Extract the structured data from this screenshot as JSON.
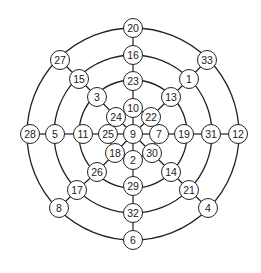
{
  "diagram": {
    "center": [
      133,
      134
    ],
    "rings": [
      106,
      79,
      54,
      24
    ],
    "ring_color": "#222222",
    "nodes": [
      {
        "label": "20",
        "x": 133,
        "y": 28
      },
      {
        "label": "16",
        "x": 133,
        "y": 55
      },
      {
        "label": "23",
        "x": 133,
        "y": 81
      },
      {
        "label": "10",
        "x": 133,
        "y": 108
      },
      {
        "label": "9",
        "x": 133,
        "y": 134
      },
      {
        "label": "2",
        "x": 133,
        "y": 160
      },
      {
        "label": "29",
        "x": 133,
        "y": 186
      },
      {
        "label": "32",
        "x": 133,
        "y": 213
      },
      {
        "label": "6",
        "x": 133,
        "y": 240
      },
      {
        "label": "28",
        "x": 30,
        "y": 134
      },
      {
        "label": "5",
        "x": 55,
        "y": 134
      },
      {
        "label": "11",
        "x": 83,
        "y": 134
      },
      {
        "label": "25",
        "x": 108,
        "y": 134
      },
      {
        "label": "7",
        "x": 159,
        "y": 134
      },
      {
        "label": "19",
        "x": 184,
        "y": 134
      },
      {
        "label": "31",
        "x": 211,
        "y": 134
      },
      {
        "label": "12",
        "x": 238,
        "y": 134
      },
      {
        "label": "27",
        "x": 60,
        "y": 60
      },
      {
        "label": "15",
        "x": 79,
        "y": 79
      },
      {
        "label": "3",
        "x": 97,
        "y": 97
      },
      {
        "label": "24",
        "x": 116,
        "y": 117
      },
      {
        "label": "33",
        "x": 207,
        "y": 60
      },
      {
        "label": "1",
        "x": 189,
        "y": 79
      },
      {
        "label": "13",
        "x": 171,
        "y": 97
      },
      {
        "label": "22",
        "x": 151,
        "y": 117
      },
      {
        "label": "18",
        "x": 115,
        "y": 153
      },
      {
        "label": "26",
        "x": 97,
        "y": 172
      },
      {
        "label": "17",
        "x": 77,
        "y": 190
      },
      {
        "label": "8",
        "x": 59,
        "y": 208
      },
      {
        "label": "30",
        "x": 152,
        "y": 153
      },
      {
        "label": "14",
        "x": 171,
        "y": 172
      },
      {
        "label": "21",
        "x": 189,
        "y": 190
      },
      {
        "label": "4",
        "x": 208,
        "y": 208
      }
    ],
    "edges": [
      [
        "20",
        "16"
      ],
      [
        "16",
        "23"
      ],
      [
        "23",
        "10"
      ],
      [
        "10",
        "9"
      ],
      [
        "9",
        "2"
      ],
      [
        "2",
        "29"
      ],
      [
        "29",
        "32"
      ],
      [
        "32",
        "6"
      ],
      [
        "28",
        "5"
      ],
      [
        "5",
        "11"
      ],
      [
        "11",
        "25"
      ],
      [
        "25",
        "9"
      ],
      [
        "9",
        "7"
      ],
      [
        "7",
        "19"
      ],
      [
        "19",
        "31"
      ],
      [
        "31",
        "12"
      ],
      [
        "27",
        "15"
      ],
      [
        "15",
        "3"
      ],
      [
        "3",
        "24"
      ],
      [
        "24",
        "9"
      ],
      [
        "33",
        "1"
      ],
      [
        "1",
        "13"
      ],
      [
        "13",
        "22"
      ],
      [
        "22",
        "9"
      ],
      [
        "18",
        "9"
      ],
      [
        "18",
        "26"
      ],
      [
        "26",
        "17"
      ],
      [
        "17",
        "8"
      ],
      [
        "30",
        "9"
      ],
      [
        "30",
        "14"
      ],
      [
        "14",
        "21"
      ],
      [
        "21",
        "4"
      ]
    ]
  }
}
